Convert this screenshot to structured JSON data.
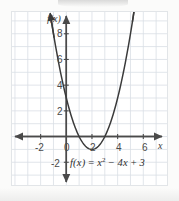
{
  "figure": {
    "kind": "cartesian-graph",
    "background_color": "#fbfbfa",
    "plot_background_color": "#ffffff",
    "frame_color": "#e2e5e8"
  },
  "chart_data": {
    "type": "line",
    "title": "",
    "subtitle": "",
    "xlabel": "x",
    "ylabel": "f(x)",
    "equation_text": "f(x) = x² − 4x + 3",
    "equation_parts": {
      "lhs": "f(x)",
      "equals": "=",
      "term1_base": "x",
      "term1_exp": "2",
      "minus": "−",
      "term2": "4x",
      "plus": "+",
      "term3": "3"
    },
    "function": "x^2 - 4x + 3",
    "xlim": [
      -3.2,
      7.2
    ],
    "ylim": [
      -3.2,
      9.8
    ],
    "x_ticks": [
      -2,
      0,
      2,
      4,
      6
    ],
    "x_tick_labels": [
      "-2",
      "0",
      "2",
      "4",
      "6"
    ],
    "y_ticks": [
      -2,
      2,
      4,
      6,
      8
    ],
    "y_tick_labels": [
      "-2",
      "2",
      "4",
      "6",
      "8"
    ],
    "grid": true,
    "grid_color": "#d9dee4",
    "grid_step": 1,
    "legend": "none",
    "axis_color": "#4a4a4a",
    "curve_color": "#3a3a3a",
    "vertex": [
      2,
      -1
    ],
    "roots": [
      1,
      3
    ],
    "y_intercept": 3,
    "x": [
      -1.0,
      -0.8,
      -0.6,
      -0.4,
      -0.2,
      0.0,
      0.2,
      0.4,
      0.6,
      0.8,
      1.0,
      1.2,
      1.4,
      1.6,
      1.8,
      2.0,
      2.2,
      2.4,
      2.6,
      2.8,
      3.0,
      3.2,
      3.4,
      3.6,
      3.8,
      4.0,
      4.2,
      4.4,
      4.6,
      4.8,
      5.0,
      5.2,
      5.4
    ],
    "values": [
      8.0,
      6.84,
      5.76,
      4.76,
      3.84,
      3.0,
      2.24,
      1.56,
      0.96,
      0.44,
      0.0,
      -0.36,
      -0.64,
      -0.84,
      -0.96,
      -1.0,
      -0.96,
      -0.84,
      -0.64,
      -0.36,
      0.0,
      0.44,
      0.96,
      1.56,
      2.24,
      3.0,
      3.84,
      4.76,
      5.76,
      6.84,
      8.0,
      9.24,
      10.56
    ]
  }
}
